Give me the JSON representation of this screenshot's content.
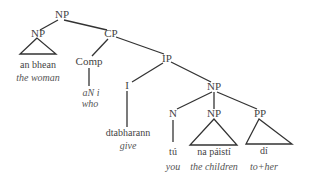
{
  "diagram": {
    "type": "syntax-tree",
    "line_color": "#333333",
    "nodes": {
      "root": "NP",
      "np_subject": "NP",
      "cp": "CP",
      "comp": "Comp",
      "ip": "IP",
      "i": "I",
      "np_inner": "NP",
      "n": "N",
      "np_object": "NP",
      "pp": "PP"
    },
    "leaves": {
      "np_subject": {
        "word": "an bhean",
        "gloss": "the woman"
      },
      "comp": {
        "word": "aN i",
        "gloss": "who"
      },
      "i": {
        "word": "dtabharann",
        "gloss": "give"
      },
      "n": {
        "word": "tú",
        "gloss": "you"
      },
      "np_object": {
        "word": "na páistí",
        "gloss": "the children"
      },
      "pp": {
        "word": "dí",
        "gloss": "to+her"
      }
    }
  }
}
